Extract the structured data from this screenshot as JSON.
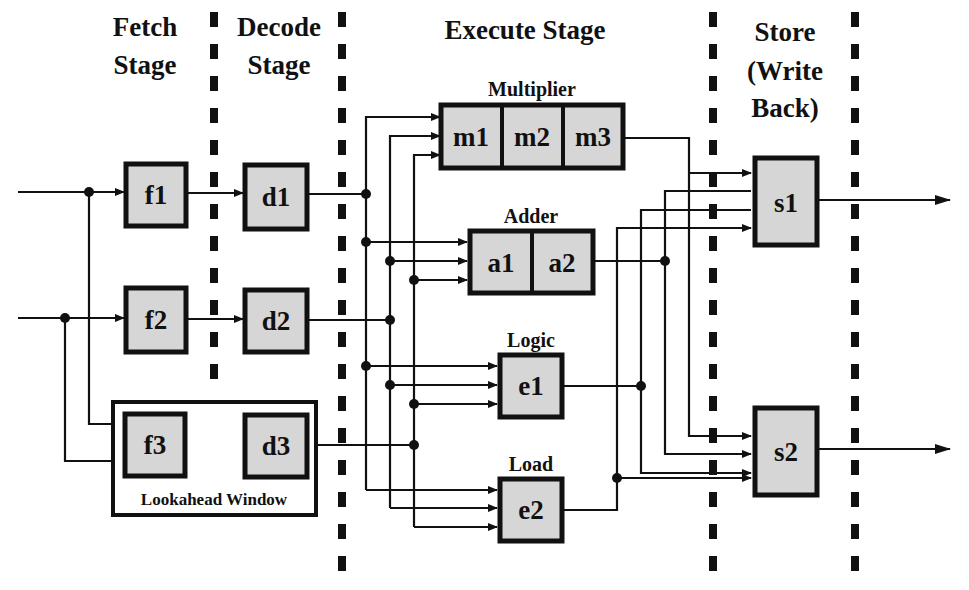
{
  "stages": {
    "fetch": {
      "line1": "Fetch",
      "line2": "Stage"
    },
    "decode": {
      "line1": "Decode",
      "line2": "Stage"
    },
    "execute": {
      "title": "Execute Stage"
    },
    "store": {
      "line1": "Store",
      "line2": "(Write",
      "line3": "Back)"
    }
  },
  "units": {
    "multiplier": {
      "label": "Multiplier",
      "stages": [
        "m1",
        "m2",
        "m3"
      ]
    },
    "adder": {
      "label": "Adder",
      "stages": [
        "a1",
        "a2"
      ]
    },
    "logic": {
      "label": "Logic",
      "stages": [
        "e1"
      ]
    },
    "load": {
      "label": "Load",
      "stages": [
        "e2"
      ]
    }
  },
  "fetch_boxes": [
    "f1",
    "f2",
    "f3"
  ],
  "decode_boxes": [
    "d1",
    "d2",
    "d3"
  ],
  "store_boxes": [
    "s1",
    "s2"
  ],
  "lookahead_window": {
    "label": "Lookahead Window"
  },
  "colors": {
    "box_fill": "#d6d6d6",
    "stroke": "#111111",
    "background": "#ffffff"
  }
}
